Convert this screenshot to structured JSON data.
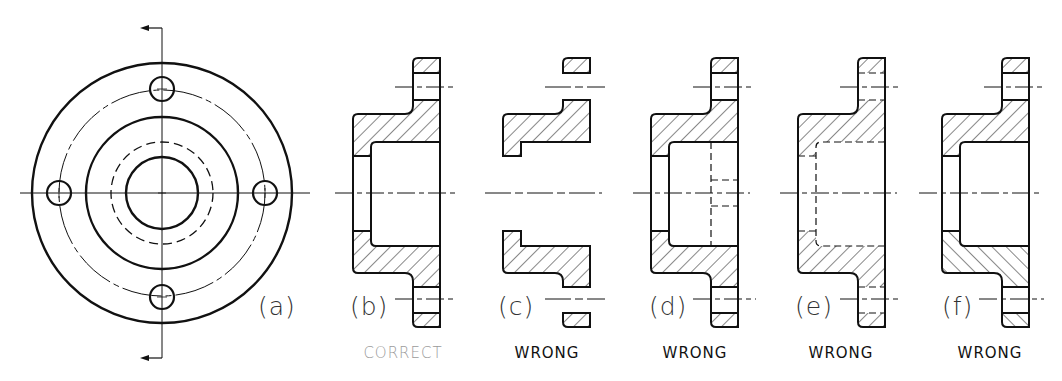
{
  "figure": {
    "views": [
      {
        "id": "a",
        "label": "(a)",
        "verdict": "",
        "kind": "front-view"
      },
      {
        "id": "b",
        "label": "(b)",
        "verdict": "CORRECT",
        "kind": "section"
      },
      {
        "id": "c",
        "label": "(c)",
        "verdict": "WRONG",
        "kind": "section-missing-visible-lines"
      },
      {
        "id": "d",
        "label": "(d)",
        "verdict": "WRONG",
        "kind": "section-with-hidden-lines"
      },
      {
        "id": "e",
        "label": "(e)",
        "verdict": "WRONG",
        "kind": "section-visible-lines-as-hidden"
      },
      {
        "id": "f",
        "label": "(f)",
        "verdict": "WRONG",
        "kind": "section-inconsistent-hatching"
      }
    ]
  },
  "colors": {
    "line": "#111111",
    "correct_text": "#9a9a9a",
    "wrong_text": "#111111"
  }
}
